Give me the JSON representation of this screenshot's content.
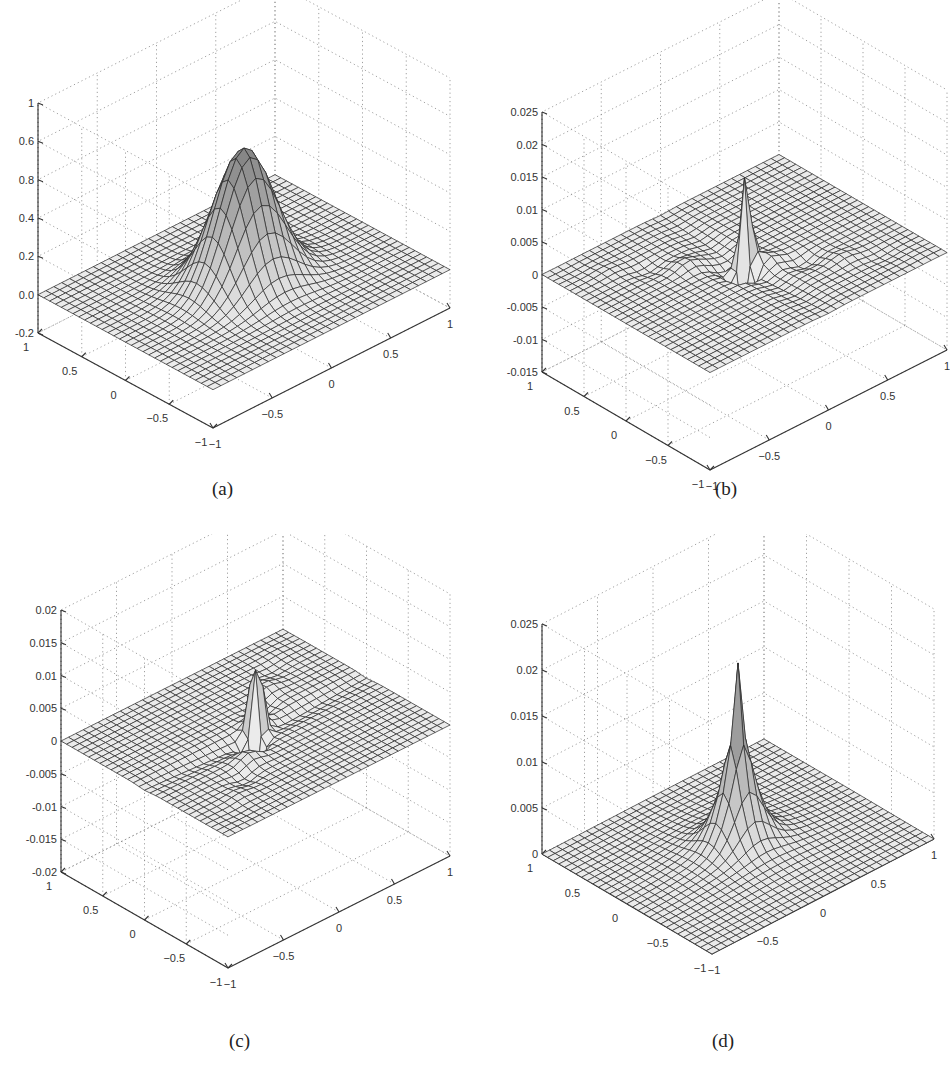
{
  "figure": {
    "panels": [
      {
        "id": "a",
        "caption": "(a)"
      },
      {
        "id": "b",
        "caption": "(b)"
      },
      {
        "id": "c",
        "caption": "(c)"
      },
      {
        "id": "d",
        "caption": "(d)"
      }
    ]
  },
  "chart_data": [
    {
      "type": "surface",
      "panel": "(a)",
      "title": "",
      "description": "Smooth Gaussian bump centered at origin, peak near 0.7, flat near 0 elsewhere",
      "x_ticks": [
        -1,
        -0.5,
        0,
        0.5,
        1
      ],
      "y_ticks": [
        -1,
        -0.5,
        0,
        0.5,
        1
      ],
      "z_tick_labels": [
        "-0.2",
        "0.0",
        "0.2",
        "0.4",
        "0.8",
        "0.6",
        "1"
      ],
      "zlim": [
        -0.2,
        1
      ],
      "xlim": [
        -1,
        1
      ],
      "ylim": [
        -1,
        1
      ],
      "grid": true,
      "mesh": 30,
      "peak_value": 0.7,
      "shape": "gaussian"
    },
    {
      "type": "surface",
      "panel": "(b)",
      "description": "Sharp positive spike at origin (~0.017) with negative trough below and ripples along the diagonal",
      "x_ticks": [
        -1,
        -0.5,
        0,
        0.5,
        1
      ],
      "y_ticks": [
        -1,
        -0.5,
        0,
        0.5,
        1
      ],
      "z_tick_labels": [
        "-0.015",
        "-0.01",
        "-0.005",
        "0",
        "0.005",
        "0.01",
        "0.015",
        "0.02",
        "0.025"
      ],
      "zlim": [
        -0.015,
        0.025
      ],
      "xlim": [
        -1,
        1
      ],
      "ylim": [
        -1,
        1
      ],
      "grid": true,
      "mesh": 30,
      "peak_value": 0.017,
      "shape": "spike-ripple"
    },
    {
      "type": "surface",
      "panel": "(c)",
      "description": "Positive spike at origin (~0.013) and negative spike (~-0.02), cross-shaped ripples",
      "x_ticks": [
        -1,
        -0.5,
        0,
        0.5,
        1
      ],
      "y_ticks": [
        -1,
        -0.5,
        0,
        0.5,
        1
      ],
      "z_tick_labels": [
        "-0.02",
        "-0.015",
        "-0.01",
        "-0.005",
        "0",
        "0.005",
        "0.01",
        "0.015",
        "0.02"
      ],
      "zlim": [
        -0.02,
        0.02
      ],
      "xlim": [
        -1,
        1
      ],
      "ylim": [
        -1,
        1
      ],
      "grid": true,
      "mesh": 30,
      "peak_value": 0.013,
      "shape": "dipole-spike"
    },
    {
      "type": "surface",
      "panel": "(d)",
      "description": "Sharp positive peak at origin (~0.019) with broad decaying base, non-negative",
      "x_ticks": [
        -1,
        -0.5,
        0,
        0.5,
        1
      ],
      "y_ticks": [
        -1,
        -0.5,
        0,
        0.5,
        1
      ],
      "z_tick_labels": [
        "0",
        "0.005",
        "0.01",
        "0.015",
        "0.02",
        "0.025"
      ],
      "zlim": [
        0,
        0.025
      ],
      "xlim": [
        -1,
        1
      ],
      "ylim": [
        -1,
        1
      ],
      "grid": true,
      "mesh": 30,
      "peak_value": 0.019,
      "shape": "sharp-peak"
    }
  ]
}
